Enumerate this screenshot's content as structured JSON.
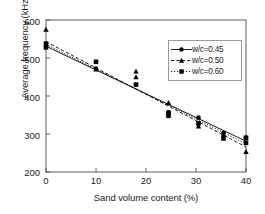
{
  "chart_data": {
    "type": "scatter",
    "title": "",
    "xlabel": "Sand volume content (%)",
    "ylabel": "Average frequency (kHz)",
    "xlim": [
      0,
      40
    ],
    "ylim": [
      200,
      600
    ],
    "xticks": [
      0,
      10,
      20,
      30,
      40
    ],
    "yticks": [
      200,
      300,
      400,
      500,
      600
    ],
    "grid": false,
    "legend_position": "upper right",
    "series": [
      {
        "name": "w/c=0.45",
        "marker": "circle",
        "line": "solid",
        "color": "#000000",
        "points": [
          {
            "x": 0.0,
            "y": 532
          },
          {
            "x": 10.0,
            "y": 472
          },
          {
            "x": 24.5,
            "y": 357
          },
          {
            "x": 30.5,
            "y": 343
          },
          {
            "x": 35.5,
            "y": 303
          },
          {
            "x": 40.0,
            "y": 290
          }
        ],
        "fit": {
          "x": [
            0,
            40
          ],
          "y": [
            531,
            281
          ]
        }
      },
      {
        "name": "w/c=0.50",
        "marker": "triangle",
        "line": "dashed",
        "color": "#000000",
        "points": [
          {
            "x": 0.0,
            "y": 575
          },
          {
            "x": 10.0,
            "y": 470
          },
          {
            "x": 18.0,
            "y": 465
          },
          {
            "x": 18.0,
            "y": 450
          },
          {
            "x": 24.5,
            "y": 382
          },
          {
            "x": 30.5,
            "y": 320
          },
          {
            "x": 35.5,
            "y": 288
          },
          {
            "x": 40.0,
            "y": 253
          }
        ],
        "fit": {
          "x": [
            0,
            40
          ],
          "y": [
            543,
            266
          ]
        }
      },
      {
        "name": "w/c=0.60",
        "marker": "square",
        "line": "dotted",
        "color": "#000000",
        "points": [
          {
            "x": 0.0,
            "y": 538
          },
          {
            "x": 0.0,
            "y": 528
          },
          {
            "x": 10.0,
            "y": 490
          },
          {
            "x": 18.0,
            "y": 430
          },
          {
            "x": 24.5,
            "y": 355
          },
          {
            "x": 24.5,
            "y": 348
          },
          {
            "x": 30.5,
            "y": 328
          },
          {
            "x": 35.5,
            "y": 292
          },
          {
            "x": 40.0,
            "y": 290
          },
          {
            "x": 40.0,
            "y": 277
          }
        ],
        "fit": {
          "x": [
            0,
            40
          ],
          "y": [
            536,
            274
          ]
        }
      }
    ]
  },
  "axes": {
    "ylabel": "Average frequency (kHz)",
    "xlabel": "Sand volume content (%)",
    "yticklabels": [
      "600",
      "500",
      "400",
      "300",
      "200"
    ],
    "xticklabels": [
      "0",
      "10",
      "20",
      "30",
      "40"
    ]
  },
  "legend": {
    "entries": [
      {
        "label": "w/c=0.45",
        "marker": "circle-marker-icon"
      },
      {
        "label": "w/c=0.50",
        "marker": "triangle-marker-icon"
      },
      {
        "label": "w/c=0.60",
        "marker": "square-marker-icon"
      }
    ]
  },
  "colors": {
    "marker": "#000000",
    "axis": "#4d4d4d",
    "legend_border": "#9a9a9a",
    "background": "#ffffff"
  }
}
